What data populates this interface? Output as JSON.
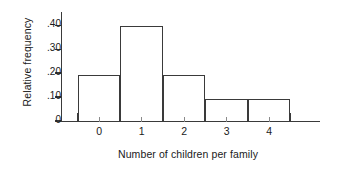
{
  "chart_data": {
    "type": "bar",
    "title": "",
    "subtitle": "",
    "xlabel": "Number of children per family",
    "ylabel": "Relative frequency",
    "categories": [
      "0",
      "1",
      "2",
      "3",
      "4"
    ],
    "values": [
      0.19,
      0.395,
      0.19,
      0.09,
      0.09
    ],
    "bin_edges": [
      -0.5,
      0.5,
      1.5,
      2.5,
      3.5,
      4.5
    ],
    "xlim": [
      -0.9,
      5.2
    ],
    "ylim": [
      0,
      0.455
    ],
    "y_tick_values": [
      0,
      0.1,
      0.2,
      0.3,
      0.4
    ],
    "y_tick_labels": [
      "0",
      ".10",
      ".20",
      ".30",
      ".40"
    ],
    "x_tick_labels": [
      "0",
      "1",
      "2",
      "3",
      "4"
    ],
    "grid": false,
    "legend": false,
    "legend_position": "none",
    "bar_style": "outline",
    "annotations": []
  },
  "figure": {
    "background_color": "#ffffff",
    "axis_color": "#3a3a3a",
    "text_color": "#1a1a1a",
    "minor_tick_color": "#8a8a8a"
  }
}
